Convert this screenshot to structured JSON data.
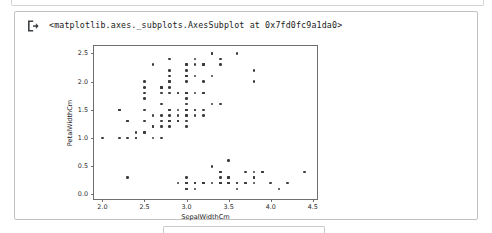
{
  "cell": {
    "icon": "output-arrow-icon",
    "repr_text": "<matplotlib.axes._subplots.AxesSubplot at 0x7fd0fc9a1da0>"
  },
  "chart_data": {
    "type": "scatter",
    "title": "",
    "xlabel": "SepalWidthCm",
    "ylabel": "PetalWidthCm",
    "xlim": [
      1.9,
      4.55
    ],
    "ylim": [
      -0.08,
      2.63
    ],
    "xticks": [
      2.0,
      2.5,
      3.0,
      3.5,
      4.0,
      4.5
    ],
    "xticklabels": [
      "2.0",
      "2.5",
      "3.0",
      "3.5",
      "4.0",
      "4.5"
    ],
    "yticks": [
      0.0,
      0.5,
      1.0,
      1.5,
      2.0,
      2.5
    ],
    "yticklabels": [
      "0.0",
      "0.5",
      "1.0",
      "1.5",
      "2.0",
      "2.5"
    ],
    "grid": false,
    "legend": null,
    "marker_color": "#3b3b3b",
    "marker_size": 2.6,
    "series": [
      {
        "name": "iris",
        "x": [
          3.5,
          3.0,
          3.2,
          3.1,
          3.6,
          3.9,
          3.4,
          3.4,
          2.9,
          3.1,
          3.7,
          3.4,
          3.0,
          3.0,
          4.0,
          4.4,
          3.9,
          3.5,
          3.8,
          3.8,
          3.4,
          3.7,
          3.6,
          3.3,
          3.4,
          3.0,
          3.4,
          3.5,
          3.4,
          3.2,
          3.1,
          3.4,
          4.1,
          4.2,
          3.1,
          3.2,
          3.5,
          3.6,
          3.0,
          3.4,
          3.5,
          2.3,
          3.2,
          3.5,
          3.8,
          3.0,
          3.8,
          3.2,
          3.7,
          3.3,
          3.2,
          3.2,
          3.1,
          2.3,
          2.8,
          2.8,
          3.3,
          2.4,
          2.9,
          2.7,
          2.0,
          3.0,
          2.2,
          2.9,
          2.9,
          3.1,
          3.0,
          2.7,
          2.2,
          2.5,
          3.2,
          2.8,
          2.5,
          2.8,
          2.9,
          3.0,
          2.8,
          3.0,
          2.9,
          2.6,
          2.4,
          2.4,
          2.7,
          2.7,
          3.0,
          3.4,
          3.1,
          2.3,
          3.0,
          2.5,
          2.6,
          3.0,
          2.6,
          2.3,
          2.7,
          3.0,
          2.9,
          2.9,
          2.5,
          2.8,
          3.3,
          2.7,
          3.0,
          2.9,
          3.0,
          3.0,
          2.5,
          2.9,
          2.5,
          3.6,
          3.2,
          2.7,
          3.0,
          2.5,
          2.8,
          3.2,
          3.0,
          3.8,
          2.6,
          2.2,
          3.2,
          2.8,
          2.8,
          2.7,
          3.3,
          3.2,
          2.8,
          3.0,
          2.8,
          3.0,
          2.8,
          3.8,
          2.8,
          2.8,
          2.6,
          3.0,
          3.4,
          3.1,
          3.0,
          3.1,
          3.1,
          3.1,
          2.7,
          3.2,
          3.3,
          3.0,
          2.5,
          3.0,
          3.4,
          3.0
        ],
        "y": [
          0.2,
          0.2,
          0.2,
          0.2,
          0.2,
          0.4,
          0.3,
          0.2,
          0.2,
          0.1,
          0.2,
          0.2,
          0.1,
          0.1,
          0.2,
          0.4,
          0.4,
          0.3,
          0.3,
          0.3,
          0.2,
          0.4,
          0.2,
          0.5,
          0.2,
          0.2,
          0.4,
          0.2,
          0.2,
          0.2,
          0.2,
          0.4,
          0.1,
          0.2,
          0.2,
          0.2,
          0.2,
          0.1,
          0.2,
          0.2,
          0.3,
          0.3,
          0.2,
          0.6,
          0.4,
          0.3,
          0.2,
          0.2,
          0.2,
          0.2,
          1.4,
          1.5,
          1.5,
          1.3,
          1.5,
          1.3,
          1.6,
          1.0,
          1.3,
          1.4,
          1.0,
          1.5,
          1.0,
          1.4,
          1.3,
          1.4,
          1.5,
          1.0,
          1.5,
          1.1,
          1.8,
          1.3,
          1.5,
          1.2,
          1.3,
          1.4,
          1.4,
          1.7,
          1.5,
          1.0,
          1.1,
          1.0,
          1.2,
          1.6,
          1.5,
          1.6,
          1.5,
          1.3,
          1.3,
          1.3,
          1.2,
          1.4,
          1.2,
          1.0,
          1.3,
          1.2,
          1.3,
          1.3,
          1.1,
          1.3,
          2.5,
          1.9,
          2.1,
          1.8,
          2.2,
          2.1,
          1.7,
          1.8,
          1.8,
          2.5,
          2.0,
          1.9,
          2.1,
          2.0,
          2.4,
          2.3,
          1.8,
          2.2,
          2.3,
          1.5,
          2.3,
          2.0,
          2.0,
          1.8,
          2.1,
          1.8,
          1.8,
          1.8,
          2.1,
          1.6,
          1.9,
          2.0,
          2.2,
          1.5,
          1.4,
          2.3,
          2.4,
          1.8,
          1.8,
          2.1,
          2.4,
          2.3,
          1.9,
          2.3,
          2.5,
          2.3,
          1.9,
          2.0,
          2.3,
          1.8
        ]
      }
    ]
  }
}
